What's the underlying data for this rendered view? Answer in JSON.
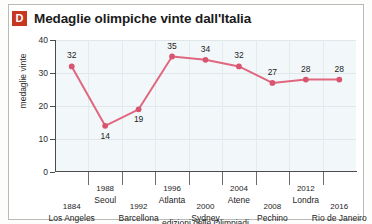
{
  "header": {
    "badge": "D",
    "title": "Medaglie olimpiche vinte dall'Italia"
  },
  "chart_data": {
    "type": "line",
    "title": "Medaglie olimpiche vinte dall'Italia",
    "xlabel": "edizioni delle Olimpiadi",
    "ylabel": "medaglie vinte",
    "ylim": [
      0,
      40
    ],
    "yticks": [
      0,
      10,
      20,
      30,
      40
    ],
    "grid": true,
    "legend": "none",
    "categories": [
      "1884 Los Angeles",
      "1988 Seoul",
      "1992 Barcellona",
      "1996 Atlanta",
      "2000 Sydney",
      "2004 Atene",
      "2008 Pechino",
      "2012 Londra",
      "2016 Rio de Janeiro"
    ],
    "years": [
      "1884",
      "1988",
      "1992",
      "1996",
      "2000",
      "2004",
      "2008",
      "2012",
      "2016"
    ],
    "cities": [
      "Los Angeles",
      "Seoul",
      "Barcellona",
      "Atlanta",
      "Sydney",
      "Atene",
      "Pechino",
      "Londra",
      "Rio de Janeiro"
    ],
    "values": [
      32,
      14,
      19,
      35,
      34,
      32,
      27,
      28,
      28
    ],
    "label_rows": [
      "low",
      "high",
      "low",
      "high",
      "low",
      "high",
      "low",
      "high",
      "low"
    ],
    "series_color": "#e0677f",
    "marker_color": "#d9546f",
    "plot_background": "#f2f8fa",
    "badge_color": "#c7361f"
  }
}
